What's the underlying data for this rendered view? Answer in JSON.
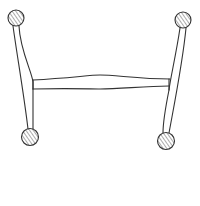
{
  "figure": {
    "stroke_color": "#333333",
    "background": "#ffffff"
  },
  "parts": {
    "balls": [
      {
        "id": "top-left",
        "cx": 16,
        "cy": 18,
        "r": 8
      },
      {
        "id": "top-right",
        "cx": 183,
        "cy": 20,
        "r": 8
      },
      {
        "id": "bottom-left",
        "cx": 30,
        "cy": 137,
        "r": 8.5
      },
      {
        "id": "bottom-right",
        "cx": 166,
        "cy": 141,
        "r": 8.5
      }
    ],
    "legs": [
      {
        "id": "left-leg"
      },
      {
        "id": "right-leg"
      }
    ],
    "stretcher": {
      "id": "center-stretcher"
    }
  }
}
